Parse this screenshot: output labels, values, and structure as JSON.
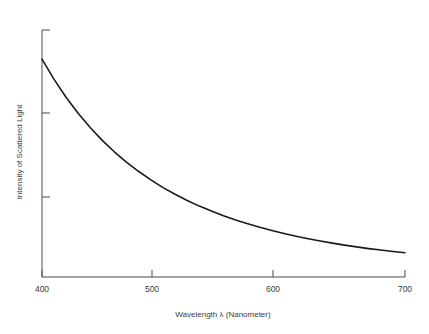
{
  "chart_data": {
    "type": "line",
    "title": "",
    "xlabel": "Wavelength λ (Nanometer)",
    "ylabel": "Intensity of Scattered Light",
    "xlim": [
      400,
      700
    ],
    "ylim": [
      0,
      1.0
    ],
    "xticks": [
      400,
      500,
      600,
      700
    ],
    "xticklabels": [
      "400",
      "500",
      "600",
      "700"
    ],
    "yticks": [
      0.3,
      0.62,
      0.94
    ],
    "yticklabels": [
      "",
      "",
      ""
    ],
    "grid": false,
    "legend": null,
    "annotations": [],
    "series": [
      {
        "name": "Scattered intensity (1/λ⁴)",
        "color": "#1a1a1a",
        "linewidth": 1.6,
        "x": [
          400,
          410,
          420,
          430,
          440,
          450,
          460,
          470,
          480,
          490,
          500,
          510,
          520,
          530,
          540,
          550,
          560,
          570,
          580,
          590,
          600,
          610,
          620,
          630,
          640,
          650,
          660,
          670,
          680,
          690,
          700
        ],
        "y": [
          0.882,
          0.8,
          0.727,
          0.662,
          0.604,
          0.552,
          0.506,
          0.464,
          0.427,
          0.393,
          0.362,
          0.335,
          0.31,
          0.287,
          0.267,
          0.248,
          0.231,
          0.216,
          0.201,
          0.188,
          0.176,
          0.165,
          0.155,
          0.146,
          0.137,
          0.129,
          0.122,
          0.115,
          0.109,
          0.103,
          0.098
        ]
      }
    ]
  },
  "axes": {
    "x_axis_label": "Wavelength λ (Nanometer)",
    "y_axis_label": "Intensity of Scattered Light",
    "x_tick_labels": [
      "400",
      "500",
      "600",
      "700"
    ],
    "axis_color": "#4a4a4a",
    "text_color": "#3a3a3a",
    "curve_color": "#1a1a1a",
    "background_color": "#ffffff"
  }
}
